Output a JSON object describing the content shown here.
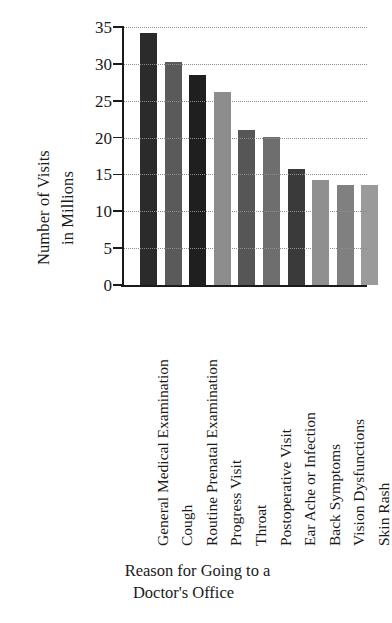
{
  "chart_data": {
    "type": "bar",
    "title": "",
    "xlabel": "Reason for Going to a Doctor's Office",
    "xlabel_lines": [
      "Reason for Going to a",
      "Doctor's Office"
    ],
    "ylabel": "Number of Visits in Millions",
    "ylabel_lines": [
      "Number of Visits",
      "in Millions"
    ],
    "categories": [
      "General Medical Examination",
      "Cough",
      "Routine Prenatal Examination",
      "Progress Visit",
      "Throat",
      "Postoperative Visit",
      "Ear Ache or Infection",
      "Back Symptoms",
      "Vision Dysfunctions",
      "Skin Rash"
    ],
    "values": [
      34.2,
      30.2,
      28.5,
      26.2,
      21.0,
      20.1,
      15.7,
      14.2,
      13.6,
      13.6
    ],
    "bar_colors": [
      "#2b2b2b",
      "#5a5a5a",
      "#1f1f1f",
      "#8d8d8d",
      "#565656",
      "#6e6e6e",
      "#3a3a3a",
      "#8f8f8f",
      "#808080",
      "#9a9a9a"
    ],
    "ylim": [
      0,
      35
    ],
    "yticks": [
      0,
      5,
      10,
      15,
      20,
      25,
      30,
      35
    ],
    "ytick_labels": [
      "0",
      "5",
      "10",
      "15",
      "20",
      "25",
      "30",
      "35"
    ],
    "grid": "horizontal-dotted",
    "legend": "none",
    "axis_color": "#1a1a1a",
    "grid_color": "#8d8d8d",
    "background": "#ffffff"
  }
}
